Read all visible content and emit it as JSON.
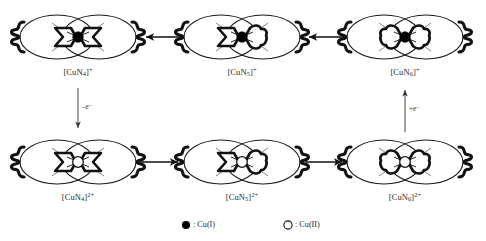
{
  "scheme": {
    "title": "Copper macrocyclic complex interconversion scheme",
    "colors": {
      "ink": "#1a1a1a",
      "filled_metal": "#000000",
      "open_metal": "#ffffff",
      "text": "#2b2b2b"
    },
    "nodes": [
      {
        "id": "cun4-plus",
        "label_text": "[CuN4]+",
        "formula_prefix": "[CuN",
        "formula_sub": "4",
        "formula_mid": "]",
        "formula_sup": "+",
        "metal_state": "Cu(I)",
        "metal_fill": "filled",
        "cavity": "square",
        "row": "top",
        "column": 1,
        "cx": 78,
        "cy": 37
      },
      {
        "id": "cun5-plus",
        "label_text": "[CuN5]+",
        "formula_prefix": "[CuN",
        "formula_sub": "5",
        "formula_mid": "]",
        "formula_sup": "+",
        "metal_state": "Cu(I)",
        "metal_fill": "filled",
        "cavity": "pentagon",
        "row": "top",
        "column": 2,
        "cx": 242,
        "cy": 37
      },
      {
        "id": "cun6-plus",
        "label_text": "[CuN6]+",
        "formula_prefix": "[CuN",
        "formula_sub": "6",
        "formula_mid": "]",
        "formula_sup": "+",
        "metal_state": "Cu(I)",
        "metal_fill": "filled",
        "cavity": "hexagon",
        "row": "top",
        "column": 3,
        "cx": 405,
        "cy": 37
      },
      {
        "id": "cun4-2plus",
        "label_text": "[CuN4]2+",
        "formula_prefix": "[CuN",
        "formula_sub": "4",
        "formula_mid": "]",
        "formula_sup": "2+",
        "metal_state": "Cu(II)",
        "metal_fill": "open",
        "cavity": "square",
        "row": "bottom",
        "column": 1,
        "cx": 78,
        "cy": 162
      },
      {
        "id": "cun5-2plus",
        "label_text": "[CuN5]2+",
        "formula_prefix": "[CuN",
        "formula_sub": "5",
        "formula_mid": "]",
        "formula_sup": "2+",
        "metal_state": "Cu(II)",
        "metal_fill": "open",
        "cavity": "pentagon",
        "row": "bottom",
        "column": 2,
        "cx": 242,
        "cy": 162
      },
      {
        "id": "cun6-2plus",
        "label_text": "[CuN6]2+",
        "formula_prefix": "[CuN",
        "formula_sub": "6",
        "formula_mid": "]",
        "formula_sup": "2+",
        "metal_state": "Cu(II)",
        "metal_fill": "open",
        "cavity": "hexagon",
        "row": "bottom",
        "column": 3,
        "cx": 405,
        "cy": 162
      }
    ],
    "arrows": [
      {
        "id": "top-right-to-mid",
        "direction": "left",
        "from": "cun6-plus",
        "to": "cun5-plus",
        "label": ""
      },
      {
        "id": "top-mid-to-left",
        "direction": "left",
        "from": "cun5-plus",
        "to": "cun4-plus",
        "label": ""
      },
      {
        "id": "bottom-left-to-mid",
        "direction": "right",
        "from": "cun4-2plus",
        "to": "cun5-2plus",
        "label": ""
      },
      {
        "id": "bottom-mid-to-right",
        "direction": "right",
        "from": "cun5-2plus",
        "to": "cun6-2plus",
        "label": ""
      },
      {
        "id": "oxidation-left",
        "direction": "down",
        "from": "cun4-plus",
        "to": "cun4-2plus",
        "label": "–e⁻"
      },
      {
        "id": "reduction-right",
        "direction": "up",
        "from": "cun6-2plus",
        "to": "cun6-plus",
        "label": "+e⁻"
      }
    ],
    "arrow_labels": {
      "oxidation": "–e",
      "oxidation_sup": "–",
      "reduction": "+e",
      "reduction_sup": "–"
    },
    "legend": {
      "items": [
        {
          "id": "legend-cu1",
          "marker": "filled-circle",
          "separator": ":",
          "label": "Cu(I)"
        },
        {
          "id": "legend-cu2",
          "marker": "open-circle",
          "separator": ":",
          "label": "Cu(II)"
        }
      ]
    }
  }
}
